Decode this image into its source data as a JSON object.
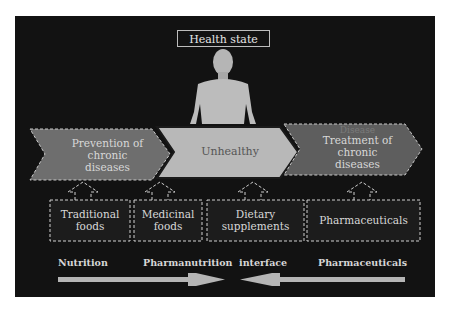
{
  "title": "Health state",
  "stages": [
    {
      "label_lines": [
        "Prevention of",
        "chronic",
        "diseases"
      ],
      "faint_label": "",
      "fill": "#6e6e6e"
    },
    {
      "label_lines": [
        "Unhealthy"
      ],
      "fill": "#b8b8b8"
    },
    {
      "label_lines": [
        "Treatment of",
        "chronic",
        "diseases"
      ],
      "faint_label": "Disease",
      "fill": "#5e5e5e"
    }
  ],
  "categories": [
    {
      "label_lines": [
        "Traditional",
        "foods"
      ]
    },
    {
      "label_lines": [
        "Medicinal",
        "foods"
      ]
    },
    {
      "label_lines": [
        "Dietary",
        "supplements"
      ]
    },
    {
      "label_lines": [
        "Pharmaceuticals"
      ]
    }
  ],
  "axis": {
    "left": "Nutrition",
    "center": "Pharmanutrition  interface",
    "right": "Pharmaceuticals"
  },
  "colors": {
    "background": "#121212",
    "border": "#bdbdbd",
    "arrow": "#b5b5b5"
  }
}
